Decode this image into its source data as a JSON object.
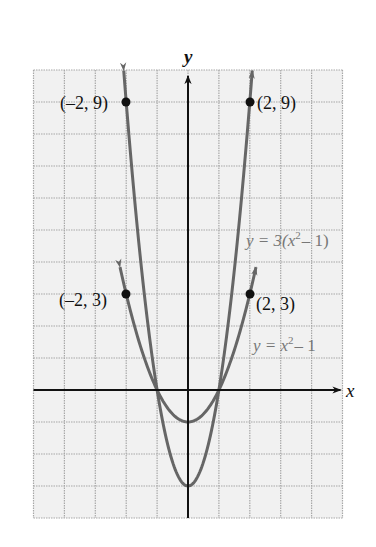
{
  "chart_data": {
    "type": "line",
    "title": "",
    "xlabel": "x",
    "ylabel": "y",
    "xlim": [
      -5,
      5
    ],
    "ylim": [
      -4,
      10
    ],
    "grid": true,
    "tick_labels_shown": false,
    "series": [
      {
        "name": "y = 3(x² − 1)",
        "expression": "3*(x*x-1)",
        "color": "#666666",
        "domain": [
          -2.08,
          2.08
        ],
        "arrows_at_ends": true,
        "sample_points": [
          [
            -2,
            9
          ],
          [
            -1,
            0
          ],
          [
            0,
            -3
          ],
          [
            1,
            0
          ],
          [
            2,
            9
          ]
        ]
      },
      {
        "name": "y = x² − 1",
        "expression": "x*x-1",
        "color": "#666666",
        "domain": [
          -2.2,
          2.2
        ],
        "arrows_at_ends": true,
        "sample_points": [
          [
            -2,
            3
          ],
          [
            -1,
            0
          ],
          [
            0,
            -1
          ],
          [
            1,
            0
          ],
          [
            2,
            3
          ]
        ]
      }
    ],
    "marked_points": [
      {
        "x": -2,
        "y": 9,
        "label": "(–2, 9)"
      },
      {
        "x": 2,
        "y": 9,
        "label": "(2, 9)"
      },
      {
        "x": -2,
        "y": 3,
        "label": "(–2, 3)"
      },
      {
        "x": 2,
        "y": 3,
        "label": "(2, 3)"
      }
    ],
    "annotations": [
      {
        "text_parts": [
          "y = 3(x",
          "2",
          " − 1)"
        ],
        "near": "upper-right curve"
      },
      {
        "text_parts": [
          "y = x",
          "2",
          " − 1"
        ],
        "near": "lower-right curve"
      }
    ]
  },
  "labels": {
    "x_axis": "x",
    "y_axis": "y",
    "pt_m2_9": "(–2, 9)",
    "pt_2_9": "(2, 9)",
    "pt_m2_3": "(–2, 3)",
    "pt_2_3": "(2, 3)",
    "eq1_a": "y = 3(x",
    "eq1_sup": "2",
    "eq1_b": "– 1)",
    "eq2_a": "y = x",
    "eq2_sup": "2",
    "eq2_b": "– 1"
  },
  "colors": {
    "grid_fill": "#f1f1f1",
    "grid_line": "#a8a8a8",
    "axis": "#111111",
    "curve": "#666666",
    "point": "#111111"
  }
}
